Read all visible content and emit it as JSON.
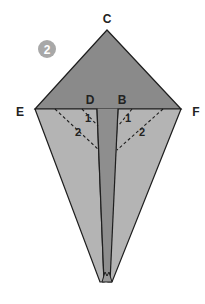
{
  "step": {
    "number": "2",
    "badge_color": "#a8a8a8"
  },
  "labels": {
    "top": "C",
    "left": "E",
    "right": "F",
    "inner_left": "D",
    "inner_right": "B"
  },
  "fold_marks": {
    "left_1": "1",
    "left_2": "2",
    "right_1": "1",
    "right_2": "2"
  },
  "colors": {
    "top_triangle": "#8a8a8a",
    "side_flaps": "#b4b4b4",
    "center_strip": "#8e8e8e",
    "outline": "#1e1e1e"
  }
}
